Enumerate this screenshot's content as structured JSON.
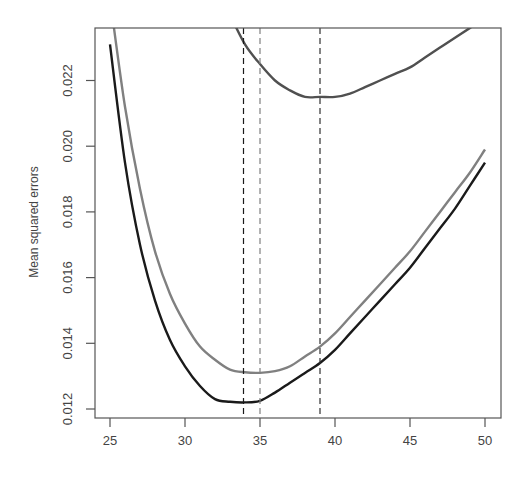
{
  "chart_data": {
    "type": "line",
    "title": "",
    "xlabel": "",
    "ylabel": "Mean squared errors",
    "xlim": [
      24.3,
      51.1
    ],
    "ylim": [
      0.0117,
      0.0236
    ],
    "xticks": [
      25,
      30,
      35,
      40,
      45,
      50
    ],
    "xtick_labels": [
      "25",
      "30",
      "35",
      "40",
      "45",
      "50"
    ],
    "yticks": [
      0.012,
      0.014,
      0.016,
      0.018,
      0.02,
      0.022
    ],
    "ytick_labels": [
      "0.012",
      "0.014",
      "0.016",
      "0.018",
      "0.020",
      "0.022"
    ],
    "grid": false,
    "legend": null,
    "series": [
      {
        "name": "black-curve",
        "color": "#1a1a1a",
        "x": [
          25,
          26,
          27,
          28,
          29,
          30,
          31,
          32,
          33,
          34,
          35,
          36,
          37,
          38,
          39,
          40,
          41,
          42,
          43,
          44,
          45,
          46,
          47,
          48,
          49,
          50
        ],
        "values": [
          0.0231,
          0.0195,
          0.017,
          0.0153,
          0.0141,
          0.0133,
          0.0127,
          0.0123,
          0.01222,
          0.0122,
          0.01225,
          0.0125,
          0.0128,
          0.0131,
          0.0134,
          0.0138,
          0.0143,
          0.0148,
          0.0153,
          0.0158,
          0.0163,
          0.0169,
          0.0175,
          0.0181,
          0.0188,
          0.0195
        ]
      },
      {
        "name": "gray-curve",
        "color": "#808080",
        "x": [
          25,
          26,
          27,
          28,
          29,
          30,
          31,
          32,
          33,
          34,
          35,
          36,
          37,
          38,
          39,
          40,
          41,
          42,
          43,
          44,
          45,
          46,
          47,
          48,
          49,
          50
        ],
        "values": [
          0.0245,
          0.0212,
          0.0187,
          0.0168,
          0.0155,
          0.0146,
          0.0139,
          0.0135,
          0.0132,
          0.01312,
          0.0131,
          0.01315,
          0.0133,
          0.0136,
          0.0139,
          0.0143,
          0.0148,
          0.0153,
          0.0158,
          0.0163,
          0.0168,
          0.0174,
          0.018,
          0.0186,
          0.0192,
          0.0199
        ]
      },
      {
        "name": "upper-curve",
        "color": "#505050",
        "x": [
          33,
          34,
          35,
          36,
          37,
          38,
          39,
          40,
          41,
          42,
          43,
          44,
          45,
          46,
          47,
          48,
          49,
          50
        ],
        "values": [
          0.024,
          0.0231,
          0.0225,
          0.022,
          0.0217,
          0.0215,
          0.0215,
          0.0215,
          0.0216,
          0.0218,
          0.022,
          0.0222,
          0.0224,
          0.0227,
          0.023,
          0.0233,
          0.0236,
          0.0239
        ]
      }
    ],
    "vlines": [
      {
        "x": 33.9,
        "color": "#1a1a1a",
        "style": "dashed",
        "note": "minimum of black curve"
      },
      {
        "x": 35,
        "color": "#808080",
        "style": "dashed",
        "note": "minimum of gray curve"
      },
      {
        "x": 39,
        "color": "#303030",
        "style": "dashed",
        "note": "minimum of upper curve"
      }
    ]
  }
}
